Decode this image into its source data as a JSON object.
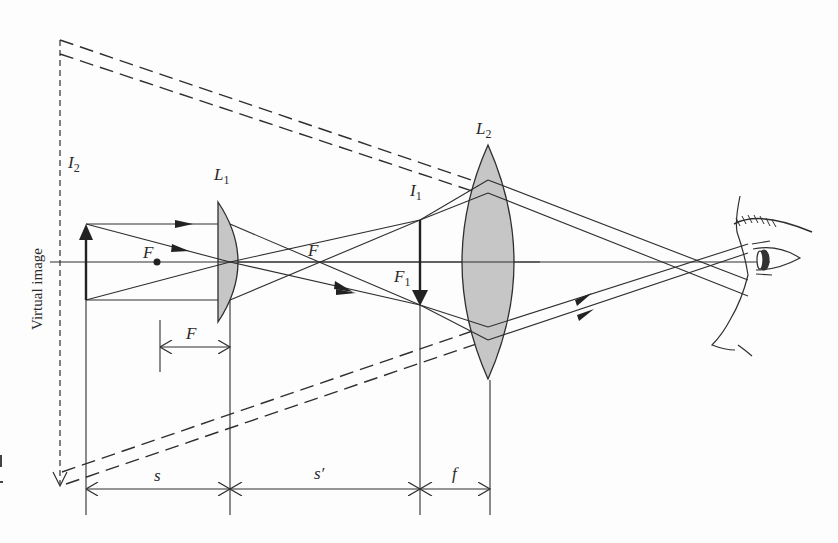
{
  "figure": {
    "labels": {
      "virtual_image": "Virtual image",
      "I2": {
        "main": "I",
        "sub": "2"
      },
      "L1": {
        "main": "L",
        "sub": "1"
      },
      "L2": {
        "main": "L",
        "sub": "2"
      },
      "I1": {
        "main": "I",
        "sub": "1"
      },
      "F1": {
        "main": "F",
        "sub": "1"
      },
      "F_left": "F",
      "F_mid": "F",
      "F_dim": "F",
      "s": "s",
      "s_prime": "s′",
      "f": "f"
    },
    "colors": {
      "line": "#2f2f2f",
      "lens_fill": "#c6c6c6",
      "background": "#fdfdfd"
    },
    "elements": {
      "objective_lens": "L1 (plano-convex)",
      "eyepiece_lens": "L2 (biconvex)",
      "object_arrow": "upright object",
      "intermediate_image": "I1 (inverted real image)",
      "final_image": "I2 (virtual image)",
      "observer": "eye-profile"
    }
  }
}
